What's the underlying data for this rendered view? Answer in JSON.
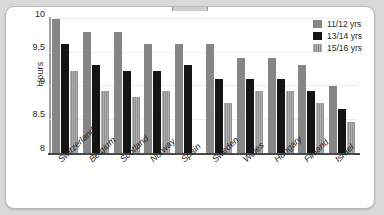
{
  "chart_data": {
    "type": "bar",
    "title": "",
    "xlabel": "",
    "ylabel": "Hours",
    "ylim": [
      8,
      10
    ],
    "yticks": [
      "8",
      "8.5",
      "9",
      "9.5",
      "10"
    ],
    "ytick_values": [
      8,
      8.5,
      9,
      9.5,
      10
    ],
    "grid": true,
    "legend_position": "top-right",
    "categories": [
      "Switzerland",
      "Belgium",
      "Scotland",
      "Norway",
      "Spain",
      "Sweden",
      "Wales",
      "Hungary",
      "Finland",
      "Israel"
    ],
    "series": [
      {
        "name": "11/12 yrs",
        "color": "#868686",
        "values": [
          10.0,
          9.8,
          9.8,
          9.62,
          9.62,
          9.62,
          9.42,
          9.42,
          9.32,
          9.0
        ]
      },
      {
        "name": "13/14 yrs",
        "color": "#141414",
        "values": [
          9.62,
          9.32,
          9.23,
          9.23,
          9.32,
          9.11,
          9.11,
          9.11,
          8.92,
          8.65
        ]
      },
      {
        "name": "15/16 yrs",
        "color": "#8f8f8f",
        "values": [
          9.23,
          8.93,
          8.83,
          8.93,
          null,
          8.75,
          8.92,
          8.92,
          8.75,
          8.46
        ]
      }
    ]
  },
  "legend": {
    "entries": [
      {
        "label": "11/12 yrs"
      },
      {
        "label": "13/14 yrs"
      },
      {
        "label": "15/16 yrs"
      }
    ]
  },
  "axis": {
    "y_title": "Hours"
  }
}
